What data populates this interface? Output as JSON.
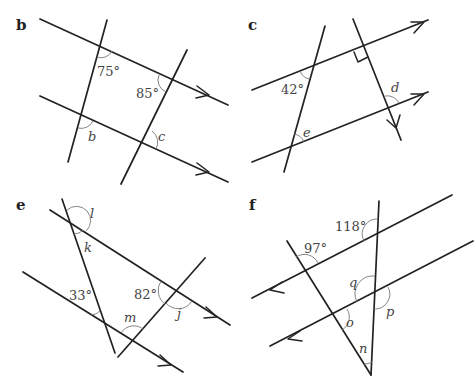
{
  "panels": {
    "b": {
      "label": "b",
      "angles": [
        "75°",
        "85°"
      ],
      "unknowns": [
        "b",
        "c"
      ]
    },
    "c": {
      "label": "c",
      "angles": [
        "42°"
      ],
      "unknowns": [
        "d",
        "e"
      ],
      "right_angle_marker": true
    },
    "e": {
      "label": "e",
      "angles": [
        "33°",
        "82°"
      ],
      "unknowns": [
        "l",
        "k",
        "m",
        "j"
      ]
    },
    "f": {
      "label": "f",
      "angles": [
        "118°",
        "97°"
      ],
      "unknowns": [
        "q",
        "p",
        "o",
        "n"
      ]
    }
  }
}
